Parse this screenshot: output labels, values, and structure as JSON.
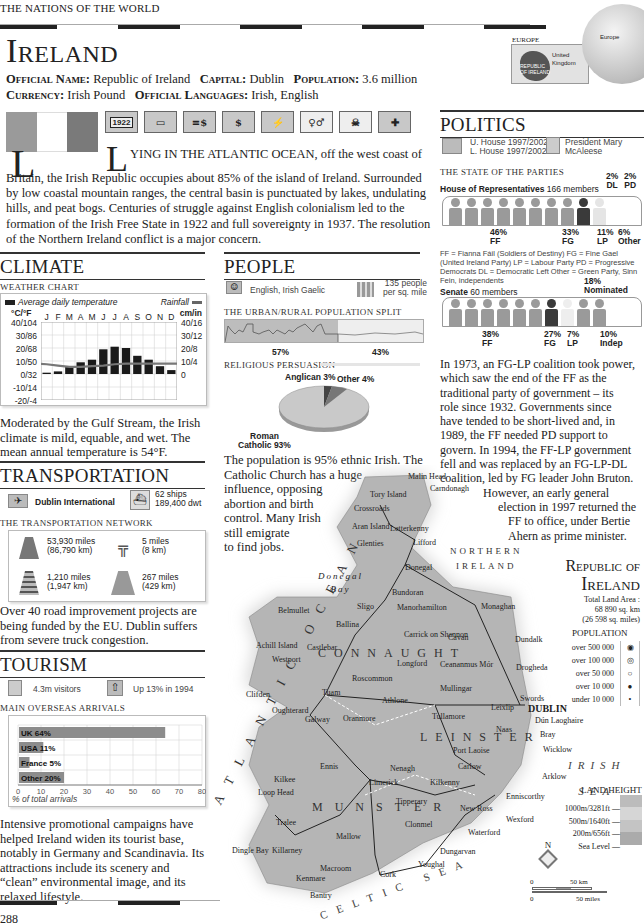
{
  "header": {
    "running_head": "THE NATIONS OF THE WORLD",
    "country_title": "Ireland",
    "facts_line1": [
      {
        "label": "Official Name:",
        "value": "Republic of Ireland"
      },
      {
        "label": "Capital:",
        "value": "Dublin"
      },
      {
        "label": "Population:",
        "value": "3.6 million"
      }
    ],
    "facts_line2": [
      {
        "label": "Currency:",
        "value": "Irish Pound"
      },
      {
        "label": "Official Languages:",
        "value": "Irish, English"
      }
    ],
    "locator": {
      "region_label": "EUROPE",
      "uk_label": "United Kingdom",
      "country_label": "REPUBLIC OF IRELAND",
      "globe_label": "Europe"
    }
  },
  "flag": {
    "colors": [
      "#9a9a9a",
      "#ffffff",
      "#7a7a7a"
    ]
  },
  "fact_icons": [
    {
      "name": "independence-year-icon",
      "text": "1922"
    },
    {
      "name": "voting-icon",
      "text": ""
    },
    {
      "name": "economy-icon",
      "text": ""
    },
    {
      "name": "currency-icon",
      "text": ""
    },
    {
      "name": "climate-icon",
      "text": ""
    },
    {
      "name": "population-icon",
      "text": ""
    },
    {
      "name": "skull-icon",
      "text": ""
    },
    {
      "name": "health-icon",
      "text": ""
    }
  ],
  "intro": {
    "dropcap": "L",
    "lead": "YING IN THE ATLANTIC OCEAN,",
    "text": " off the west coast of Britain, the Irish Republic occupies about 85% of the island of Ireland. Surrounded by low coastal mountain ranges, the central basin is punctuated by lakes, undulating hills, and peat bogs. Centuries of struggle against English colonialism led to the formation of the Irish Free State in 1922 and full sovereignty in 1937. The resolution of the Northern Ireland conflict is a major concern."
  },
  "climate": {
    "heading": "CLIMATE",
    "subhead": "WEATHER CHART",
    "legend_temp": "Average daily temperature",
    "legend_rain": "Rainfall",
    "left_unit": "°C/°F",
    "right_unit": "cm/in",
    "body": "Moderated by the Gulf Stream, the Irish climate is mild, equable, and wet. The mean annual temperature is 54°F."
  },
  "transportation": {
    "heading": "TRANSPORTATION",
    "airport": "Dublin International",
    "ships": "62 ships",
    "dwt": "189,400 dwt",
    "subhead": "THE TRANSPORTATION NETWORK",
    "network": [
      {
        "icon": "road-icon",
        "line1": "53,930 miles",
        "line2": "(86,790 km)"
      },
      {
        "icon": "motorway-icon",
        "line1": "5 miles",
        "line2": "(8 km)"
      },
      {
        "icon": "railway-icon",
        "line1": "1,210 miles",
        "line2": "(1,947 km)"
      },
      {
        "icon": "waterway-icon",
        "line1": "267 miles",
        "line2": "(429 km)"
      }
    ],
    "body": "Over 40 road improvement projects are being funded by the EU. Dublin suffers from severe truck congestion."
  },
  "tourism": {
    "heading": "TOURISM",
    "visitors": "4.3m visitors",
    "growth": "Up 13% in 1994",
    "subhead": "MAIN OVERSEAS ARRIVALS",
    "axis_caption": "% of total arrivals",
    "body": "Intensive promotional campaigns have helped Ireland widen its tourist base, notably in Germany and Scandinavia. Its attractions include its scenery and “clean” environmental image, and its relaxed lifestyle."
  },
  "people": {
    "heading": "PEOPLE",
    "languages": "English, Irish Gaelic",
    "density_line1": "135 people",
    "density_line2": "per sq. mile",
    "split_subhead": "THE URBAN/RURAL POPULATION SPLIT",
    "urban_pct": "57%",
    "rural_pct": "43%",
    "religion_subhead": "RELIGIOUS PERSUASION",
    "anglican_label": "Anglican 3%",
    "other_label": "Other 4%",
    "catholic_label_1": "Roman",
    "catholic_label_2": "Catholic 93%",
    "body_full": "The population is 95% ethnic Irish. The",
    "body_lines": [
      "Catholic Church has a huge",
      "influence, opposing",
      "abortion and birth",
      "control. Many Irish",
      "still emigrate",
      "to find jobs."
    ]
  },
  "politics": {
    "heading": "POLITICS",
    "houses_1": "U. House 1997/2002",
    "houses_2": "L. House 1997/2002",
    "president_1": "President Mary",
    "president_2": "McAleese",
    "parties_subhead": "THE STATE OF THE PARTIES",
    "lower_label": "House of Representatives",
    "lower_count": "166 members",
    "lower_parties": [
      {
        "pct": "46%",
        "abbr": "FF"
      },
      {
        "pct": "33%",
        "abbr": "FG"
      },
      {
        "pct": "11%",
        "abbr": "LP"
      },
      {
        "pct": "6%",
        "abbr": "Other"
      },
      {
        "pct": "2%",
        "abbr": "DL"
      },
      {
        "pct": "2%",
        "abbr": "PD"
      }
    ],
    "key": "FF = Fianna Fáil (Soldiers of Destiny)  FG = Fine Gael (United Ireland Party)  LP = Labour Party  PD = Progressive Democrats  DL = Democratic Left  Other = Green Party, Sinn Fein, independents",
    "senate_label": "Senate",
    "senate_count": "60 members",
    "senate_parties": [
      {
        "pct": "38%",
        "abbr": "FF"
      },
      {
        "pct": "27%",
        "abbr": "FG"
      },
      {
        "pct": "7%",
        "abbr": "LP"
      },
      {
        "pct": "18%",
        "abbr": "Nominated"
      },
      {
        "pct": "10%",
        "abbr": "Indep"
      }
    ],
    "body_lines": [
      "In 1973, an FG-LP coalition took power,",
      "which saw the end of the FF as the",
      "traditional party of government – its",
      "role since 1932. Governments since",
      "have tended to be short-lived and, in",
      "1989, the FF needed PD support to",
      "govern. In 1994, the FF-LP government",
      "fell and was replaced by an FG-LP-DL",
      "coalition, led by FG leader John Bruton."
    ],
    "body_indented": [
      "However, an early general",
      "election in 1997 returned the",
      "FF to office, under Bertie",
      "Ahern as prime minister."
    ]
  },
  "map": {
    "title_1": "Republic of",
    "title_2": "Ireland",
    "area_1": "Total Land Area :",
    "area_2": "68 890 sq. km",
    "area_3": "(26 598 sq. miles)",
    "population_heading": "POPULATION",
    "population_legend": [
      "over 500 000",
      "over 100 000",
      "over 50 000",
      "over 10 000",
      "under 10 000"
    ],
    "land_height_heading": "LAND HEIGHT",
    "land_height_legend": [
      "1000m/3281ft",
      "500m/1640ft",
      "200m/656ft",
      "Sea Level"
    ],
    "scale_km": "50 km",
    "scale_miles": "50 miles",
    "scale_zero": "0",
    "north": "N",
    "sea_labels": {
      "atlantic": "ATLANTIC OCEAN",
      "irish_sea_1": "IRISH",
      "irish_sea_2": "SEA",
      "celtic": "CELTIC SEA",
      "northern_ireland_1": "NORTHERN",
      "northern_ireland_2": "IRELAND",
      "donegal_bay_1": "Donegal",
      "donegal_bay_2": "Bay"
    },
    "provinces": [
      "CONNAUGHT",
      "LEINSTER",
      "MUNSTER"
    ],
    "places": [
      {
        "name": "Malin Head",
        "x": 408,
        "y": 472
      },
      {
        "name": "Carndonagh",
        "x": 430,
        "y": 484
      },
      {
        "name": "Tory Island",
        "x": 370,
        "y": 490
      },
      {
        "name": "Crossroads",
        "x": 354,
        "y": 504
      },
      {
        "name": "Aran Island",
        "x": 352,
        "y": 522
      },
      {
        "name": "Letterkenny",
        "x": 390,
        "y": 524
      },
      {
        "name": "Glenties",
        "x": 357,
        "y": 539
      },
      {
        "name": "Lifford",
        "x": 413,
        "y": 538
      },
      {
        "name": "Donegal",
        "x": 405,
        "y": 563
      },
      {
        "name": "Bundoran",
        "x": 392,
        "y": 588
      },
      {
        "name": "Sligo",
        "x": 357,
        "y": 602
      },
      {
        "name": "Manorhamilton",
        "x": 397,
        "y": 603
      },
      {
        "name": "Monaghan",
        "x": 481,
        "y": 602
      },
      {
        "name": "Belmullet",
        "x": 278,
        "y": 606
      },
      {
        "name": "Ballina",
        "x": 336,
        "y": 620
      },
      {
        "name": "Carrick on Shannon",
        "x": 404,
        "y": 630
      },
      {
        "name": "Cavan",
        "x": 448,
        "y": 633
      },
      {
        "name": "Dundalk",
        "x": 515,
        "y": 635
      },
      {
        "name": "Achill Island",
        "x": 256,
        "y": 641
      },
      {
        "name": "Castlebar",
        "x": 307,
        "y": 643
      },
      {
        "name": "Westport",
        "x": 272,
        "y": 655
      },
      {
        "name": "Longford",
        "x": 397,
        "y": 659
      },
      {
        "name": "Ceananmus Mór",
        "x": 440,
        "y": 660
      },
      {
        "name": "Drogheda",
        "x": 516,
        "y": 663
      },
      {
        "name": "Roscommon",
        "x": 352,
        "y": 674
      },
      {
        "name": "Mullingar",
        "x": 440,
        "y": 684
      },
      {
        "name": "Clifden",
        "x": 246,
        "y": 690
      },
      {
        "name": "Tuam",
        "x": 322,
        "y": 688
      },
      {
        "name": "Athlone",
        "x": 382,
        "y": 696
      },
      {
        "name": "Swords",
        "x": 520,
        "y": 694
      },
      {
        "name": "Oughterard",
        "x": 272,
        "y": 706
      },
      {
        "name": "Galway",
        "x": 305,
        "y": 715
      },
      {
        "name": "Oranmore",
        "x": 343,
        "y": 714
      },
      {
        "name": "Tullamore",
        "x": 432,
        "y": 712
      },
      {
        "name": "DUBLIN",
        "x": 528,
        "y": 703
      },
      {
        "name": "Leixlip",
        "x": 491,
        "y": 703
      },
      {
        "name": "Dún Laoghaire",
        "x": 535,
        "y": 716
      },
      {
        "name": "Naas",
        "x": 496,
        "y": 725
      },
      {
        "name": "Bray",
        "x": 540,
        "y": 730
      },
      {
        "name": "Port Laoise",
        "x": 453,
        "y": 746
      },
      {
        "name": "Wicklow",
        "x": 543,
        "y": 745
      },
      {
        "name": "Ennis",
        "x": 320,
        "y": 762
      },
      {
        "name": "Nenagh",
        "x": 390,
        "y": 764
      },
      {
        "name": "Carlow",
        "x": 458,
        "y": 762
      },
      {
        "name": "Kilkee",
        "x": 274,
        "y": 775
      },
      {
        "name": "Limerick",
        "x": 369,
        "y": 778
      },
      {
        "name": "Kilkenny",
        "x": 430,
        "y": 778
      },
      {
        "name": "Arklow",
        "x": 542,
        "y": 772
      },
      {
        "name": "Loop Head",
        "x": 258,
        "y": 788
      },
      {
        "name": "Tipperary",
        "x": 396,
        "y": 797
      },
      {
        "name": "Enniscorthy",
        "x": 506,
        "y": 792
      },
      {
        "name": "New Ross",
        "x": 460,
        "y": 804
      },
      {
        "name": "Tralee",
        "x": 276,
        "y": 818
      },
      {
        "name": "Clonmel",
        "x": 405,
        "y": 820
      },
      {
        "name": "Wexford",
        "x": 506,
        "y": 815
      },
      {
        "name": "Waterford",
        "x": 468,
        "y": 828
      },
      {
        "name": "Mallow",
        "x": 336,
        "y": 832
      },
      {
        "name": "Dingle Bay",
        "x": 232,
        "y": 846
      },
      {
        "name": "Killarney",
        "x": 272,
        "y": 846
      },
      {
        "name": "Dungarvan",
        "x": 440,
        "y": 847
      },
      {
        "name": "Macroom",
        "x": 320,
        "y": 864
      },
      {
        "name": "Youghal",
        "x": 418,
        "y": 860
      },
      {
        "name": "Kenmare",
        "x": 296,
        "y": 874
      },
      {
        "name": "Cork",
        "x": 380,
        "y": 870
      },
      {
        "name": "Bantry",
        "x": 310,
        "y": 891
      }
    ]
  },
  "footer": {
    "page_number": "288"
  },
  "chart_data": [
    {
      "type": "bar",
      "title": "WEATHER CHART",
      "categories": [
        "J",
        "F",
        "M",
        "A",
        "M",
        "J",
        "J",
        "A",
        "S",
        "O",
        "N",
        "D"
      ],
      "series": [
        {
          "name": "Average daily temperature (°C)",
          "type": "bar",
          "values": [
            1,
            2,
            6,
            9,
            11,
            19,
            21,
            20,
            14,
            11,
            6,
            3
          ]
        },
        {
          "name": "Rainfall (cm)",
          "type": "line",
          "values": [
            7.5,
            6.5,
            5.5,
            5.5,
            6,
            6.5,
            7.5,
            8,
            8,
            8,
            8,
            8
          ]
        }
      ],
      "ylabel_left": "°C/°F",
      "ylabel_right": "cm/in",
      "left_ticks": [
        "40/104",
        "30/86",
        "20/68",
        "10/50",
        "0/32",
        "-10/14",
        "-20/-4"
      ],
      "right_ticks": [
        "40/16",
        "30/12",
        "20/8",
        "10/4",
        "0"
      ],
      "ylim": [
        -20,
        40
      ],
      "grid": true,
      "legend": [
        "Average daily temperature",
        "Rainfall"
      ]
    },
    {
      "type": "bar",
      "orientation": "horizontal",
      "title": "MAIN OVERSEAS ARRIVALS",
      "categories": [
        "UK",
        "USA",
        "France",
        "Other"
      ],
      "values": [
        64,
        11,
        5,
        20
      ],
      "labels": [
        "UK 64%",
        "USA 11%",
        "France 5%",
        "Other 20%"
      ],
      "xlabel": "% of total arrivals",
      "x_ticks": [
        0,
        10,
        20,
        30,
        40,
        50,
        60,
        70,
        80
      ],
      "xlim": [
        0,
        80
      ],
      "grid": true
    },
    {
      "type": "pie",
      "title": "RELIGIOUS PERSUASION",
      "categories": [
        "Roman Catholic",
        "Anglican",
        "Other"
      ],
      "values": [
        93,
        3,
        4
      ]
    },
    {
      "type": "bar",
      "title": "THE URBAN/RURAL POPULATION SPLIT",
      "categories": [
        "Urban",
        "Rural"
      ],
      "values": [
        57,
        43
      ]
    },
    {
      "type": "bar",
      "title": "House of Representatives 166 members",
      "categories": [
        "FF",
        "FG",
        "LP",
        "Other",
        "DL",
        "PD"
      ],
      "values": [
        46,
        33,
        11,
        6,
        2,
        2
      ]
    },
    {
      "type": "bar",
      "title": "Senate 60 members",
      "categories": [
        "FF",
        "FG",
        "LP",
        "Indep",
        "Nominated"
      ],
      "values": [
        38,
        27,
        7,
        10,
        18
      ]
    }
  ]
}
